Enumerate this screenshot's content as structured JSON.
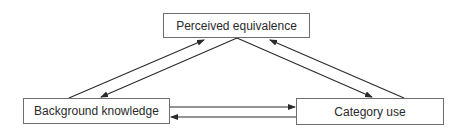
{
  "diagram": {
    "nodes": [
      {
        "id": "perceived",
        "label": "Perceived equivalence"
      },
      {
        "id": "background",
        "label": "Background knowledge"
      },
      {
        "id": "category",
        "label": "Category use"
      }
    ],
    "edges": [
      {
        "from": "background",
        "to": "perceived"
      },
      {
        "from": "perceived",
        "to": "background"
      },
      {
        "from": "perceived",
        "to": "category"
      },
      {
        "from": "category",
        "to": "perceived"
      },
      {
        "from": "background",
        "to": "category"
      },
      {
        "from": "category",
        "to": "background"
      }
    ],
    "colors": {
      "line": "#2a2a2a",
      "border": "#6e6e6e",
      "text": "#2a2a2a"
    }
  }
}
